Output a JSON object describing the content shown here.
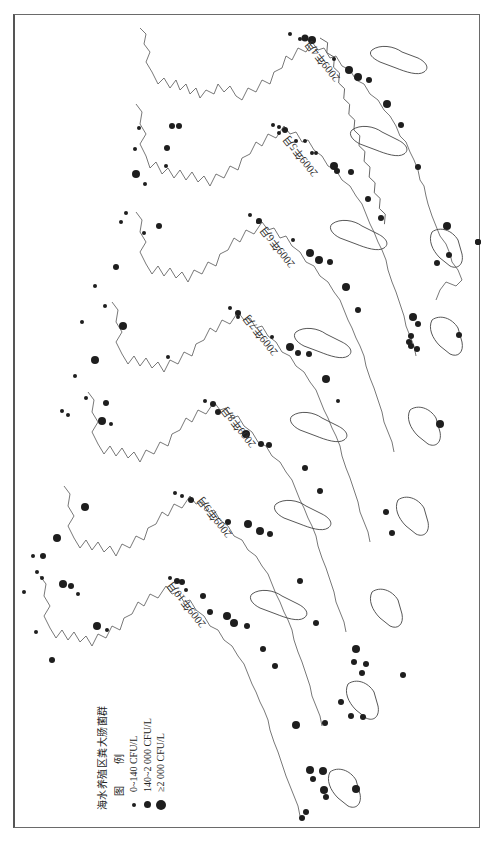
{
  "figure": {
    "orientation": "rotated 90 degrees (landscape page shown in portrait)",
    "panels": [
      {
        "id": "apr",
        "label": "2009年4月"
      },
      {
        "id": "may",
        "label": "2009年5月"
      },
      {
        "id": "jun",
        "label": "2009年6月"
      },
      {
        "id": "jul",
        "label": "2009年7月"
      },
      {
        "id": "aug",
        "label": "2009年8月"
      },
      {
        "id": "sep",
        "label": "2009年9月"
      },
      {
        "id": "oct",
        "label": "2009年10月"
      }
    ]
  },
  "legend": {
    "title": "海水养殖区粪大肠菌群",
    "subtitle": "图 例",
    "items": [
      {
        "label": "0~140 CFU/L",
        "size": "small"
      },
      {
        "label": "140~2 000 CFU/L",
        "size": "medium"
      },
      {
        "label": "≥2 000 CFU/L",
        "size": "large"
      }
    ]
  },
  "colors": {
    "dot": "#1e1e1e",
    "coastline": "#555555",
    "frame": "#6a6a6a",
    "background": "#ffffff"
  }
}
